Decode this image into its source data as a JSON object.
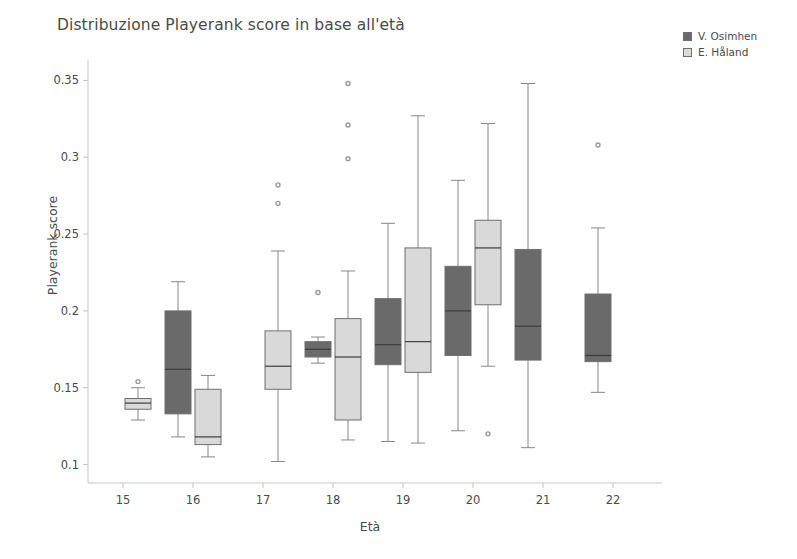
{
  "chart_data": {
    "type": "box",
    "title": "Distribuzione Playerank score in base all'età",
    "xlabel": "Età",
    "ylabel": "Playerank score",
    "categories": [
      "15",
      "16",
      "17",
      "18",
      "19",
      "20",
      "21",
      "22"
    ],
    "xlim": [
      14.5,
      22.5
    ],
    "ylim": [
      0.088,
      0.362
    ],
    "yticks": [
      0.1,
      0.15,
      0.2,
      0.25,
      0.3,
      0.35
    ],
    "ytick_labels": [
      "0.1",
      "0.15",
      "0.2",
      "0.25",
      "0.3",
      "0.35"
    ],
    "grid": false,
    "legend_position": "right",
    "colors": {
      "osimhen_fill": "#6a6a6a",
      "haland_fill": "#d9d9d9",
      "edge": "#6f6f6f",
      "whisker": "#888888",
      "outlier": "#9a9a9a",
      "text": "#4a4a4a",
      "axis": "#c8c8c8"
    },
    "series": [
      {
        "name": "V. Osimhen",
        "key": "osimhen",
        "color": "#6a6a6a",
        "boxes": [
          {
            "category": "15",
            "present": false
          },
          {
            "category": "16",
            "present": true,
            "whisker_low": 0.118,
            "q1": 0.133,
            "median": 0.162,
            "q3": 0.2,
            "whisker_high": 0.219,
            "outliers": []
          },
          {
            "category": "17",
            "present": false
          },
          {
            "category": "18",
            "present": true,
            "whisker_low": 0.166,
            "q1": 0.17,
            "median": 0.175,
            "q3": 0.18,
            "whisker_high": 0.183,
            "outliers": [
              0.212
            ]
          },
          {
            "category": "19",
            "present": true,
            "whisker_low": 0.115,
            "q1": 0.165,
            "median": 0.178,
            "q3": 0.208,
            "whisker_high": 0.257,
            "outliers": []
          },
          {
            "category": "20",
            "present": true,
            "whisker_low": 0.122,
            "q1": 0.171,
            "median": 0.2,
            "q3": 0.229,
            "whisker_high": 0.285,
            "outliers": []
          },
          {
            "category": "21",
            "present": true,
            "whisker_low": 0.111,
            "q1": 0.168,
            "median": 0.19,
            "q3": 0.24,
            "whisker_high": 0.348,
            "outliers": []
          },
          {
            "category": "22",
            "present": true,
            "whisker_low": 0.147,
            "q1": 0.167,
            "median": 0.171,
            "q3": 0.211,
            "whisker_high": 0.254,
            "outliers": [
              0.308
            ]
          }
        ]
      },
      {
        "name": "E. Håland",
        "key": "haland",
        "color": "#d9d9d9",
        "boxes": [
          {
            "category": "15",
            "present": true,
            "whisker_low": 0.129,
            "q1": 0.136,
            "median": 0.14,
            "q3": 0.143,
            "whisker_high": 0.15,
            "outliers": [
              0.154
            ]
          },
          {
            "category": "16",
            "present": true,
            "whisker_low": 0.105,
            "q1": 0.113,
            "median": 0.118,
            "q3": 0.149,
            "whisker_high": 0.158,
            "outliers": []
          },
          {
            "category": "17",
            "present": true,
            "whisker_low": 0.102,
            "q1": 0.149,
            "median": 0.164,
            "q3": 0.187,
            "whisker_high": 0.239,
            "outliers": [
              0.282,
              0.27
            ]
          },
          {
            "category": "18",
            "present": true,
            "whisker_low": 0.116,
            "q1": 0.129,
            "median": 0.17,
            "q3": 0.195,
            "whisker_high": 0.226,
            "outliers": [
              0.348,
              0.321,
              0.299
            ]
          },
          {
            "category": "19",
            "present": true,
            "whisker_low": 0.114,
            "q1": 0.16,
            "median": 0.18,
            "q3": 0.241,
            "whisker_high": 0.327,
            "outliers": []
          },
          {
            "category": "20",
            "present": true,
            "whisker_low": 0.164,
            "q1": 0.204,
            "median": 0.241,
            "q3": 0.259,
            "whisker_high": 0.322,
            "outliers": [
              0.12
            ]
          },
          {
            "category": "21",
            "present": false
          },
          {
            "category": "22",
            "present": false
          }
        ]
      }
    ]
  },
  "legend": {
    "items": [
      {
        "label": "V. Osimhen",
        "color": "#6a6a6a"
      },
      {
        "label": "E. Håland",
        "color": "#d9d9d9"
      }
    ]
  }
}
